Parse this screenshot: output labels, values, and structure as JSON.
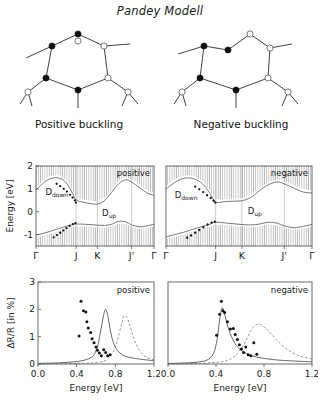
{
  "figure": {
    "title": "Pandey Modell",
    "captions": {
      "left": "Positive buckling",
      "right": "Negative buckling"
    }
  },
  "structures": {
    "left": {
      "name": "positive-buckling-chain",
      "buckling": "positive",
      "atom_fill_legend": {
        "filled": "raised atom",
        "open": "lowered atom"
      }
    },
    "right": {
      "name": "negative-buckling-chain",
      "buckling": "negative",
      "atom_fill_legend": {
        "filled": "raised atom",
        "open": "lowered atom"
      }
    }
  },
  "chart_data": [
    {
      "id": "band-positive",
      "type": "line",
      "title": "",
      "corner_label": "positive",
      "xlabel": "",
      "ylabel": "Energy [eV]",
      "ylim": [
        -1.5,
        2
      ],
      "yticks": [
        2,
        1,
        0,
        -1
      ],
      "ytick_labels": [
        "2",
        "1",
        "0",
        "-1"
      ],
      "kpoints": [
        "Γ",
        "J",
        "K",
        "J'",
        "Γ"
      ],
      "kpositions": [
        0,
        0.34,
        0.52,
        0.81,
        1.0
      ],
      "band_labels": [
        {
          "text": "D",
          "sub": "down",
          "x": 0.08,
          "y": 0.72
        },
        {
          "text": "D",
          "sub": "up",
          "x": 0.56,
          "y": -0.18
        }
      ],
      "series": [
        {
          "name": "D_down",
          "x": [
            0.0,
            0.05,
            0.1,
            0.15,
            0.2,
            0.25,
            0.3,
            0.34,
            0.4,
            0.46,
            0.52,
            0.58,
            0.64,
            0.7,
            0.76,
            0.81,
            0.88,
            0.94,
            1.0
          ],
          "values": [
            0.95,
            1.2,
            1.4,
            1.48,
            1.46,
            1.3,
            0.9,
            0.52,
            0.42,
            0.36,
            0.33,
            0.48,
            0.85,
            1.22,
            1.4,
            1.3,
            1.05,
            0.82,
            0.72
          ]
        },
        {
          "name": "D_up",
          "x": [
            0.0,
            0.06,
            0.12,
            0.18,
            0.24,
            0.3,
            0.34,
            0.42,
            0.5,
            0.58,
            0.64,
            0.7,
            0.76,
            0.81,
            0.88,
            0.94,
            1.0
          ],
          "values": [
            -1.02,
            -0.95,
            -0.86,
            -0.76,
            -0.66,
            -0.58,
            -0.54,
            -0.55,
            -0.58,
            -0.6,
            -0.55,
            -0.42,
            -0.44,
            -0.58,
            -0.66,
            -0.62,
            -0.55
          ]
        }
      ],
      "experimental_points": [
        {
          "x": 0.175,
          "y": 1.22
        },
        {
          "x": 0.205,
          "y": 1.12
        },
        {
          "x": 0.235,
          "y": 1.0
        },
        {
          "x": 0.262,
          "y": 0.88
        },
        {
          "x": 0.288,
          "y": 0.74
        },
        {
          "x": 0.31,
          "y": 0.62
        },
        {
          "x": 0.33,
          "y": 0.5
        },
        {
          "x": 0.338,
          "y": 0.4
        },
        {
          "x": 0.15,
          "y": -1.12
        },
        {
          "x": 0.178,
          "y": -1.02
        },
        {
          "x": 0.205,
          "y": -0.92
        },
        {
          "x": 0.232,
          "y": -0.82
        },
        {
          "x": 0.258,
          "y": -0.72
        },
        {
          "x": 0.285,
          "y": -0.62
        },
        {
          "x": 0.312,
          "y": -0.54
        },
        {
          "x": 0.334,
          "y": -0.5
        }
      ],
      "shaded_regions": "projected bulk bands (vertical hatching)"
    },
    {
      "id": "band-negative",
      "type": "line",
      "title": "",
      "corner_label": "negative",
      "xlabel": "",
      "ylabel": "",
      "ylim": [
        -1.5,
        2
      ],
      "yticks": [
        2,
        1,
        0,
        -1
      ],
      "ytick_labels": [
        "2",
        "1",
        "0",
        "-1"
      ],
      "kpoints": [
        "Γ",
        "J",
        "K",
        "J'",
        "Γ"
      ],
      "kpositions": [
        0,
        0.34,
        0.52,
        0.81,
        1.0
      ],
      "band_labels": [
        {
          "text": "D",
          "sub": "down",
          "x": 0.06,
          "y": 0.62
        },
        {
          "text": "D",
          "sub": "up",
          "x": 0.56,
          "y": -0.12
        }
      ],
      "series": [
        {
          "name": "D_down",
          "x": [
            0.0,
            0.05,
            0.1,
            0.15,
            0.2,
            0.25,
            0.3,
            0.34,
            0.4,
            0.46,
            0.52,
            0.58,
            0.64,
            0.7,
            0.76,
            0.81,
            0.88,
            0.94,
            1.0
          ],
          "values": [
            1.0,
            1.24,
            1.42,
            1.48,
            1.42,
            1.22,
            0.82,
            0.42,
            0.44,
            0.46,
            0.48,
            0.62,
            0.92,
            1.18,
            1.3,
            1.22,
            1.02,
            0.86,
            0.82
          ]
        },
        {
          "name": "D_up",
          "x": [
            0.0,
            0.06,
            0.12,
            0.18,
            0.24,
            0.3,
            0.34,
            0.42,
            0.5,
            0.58,
            0.64,
            0.7,
            0.76,
            0.81,
            0.88,
            0.94,
            1.0
          ],
          "values": [
            -1.1,
            -1.0,
            -0.9,
            -0.78,
            -0.66,
            -0.55,
            -0.46,
            -0.5,
            -0.55,
            -0.58,
            -0.54,
            -0.46,
            -0.5,
            -0.62,
            -0.7,
            -0.64,
            -0.56
          ]
        }
      ],
      "experimental_points": [
        {
          "x": 0.2,
          "y": 1.1
        },
        {
          "x": 0.228,
          "y": 0.98
        },
        {
          "x": 0.255,
          "y": 0.86
        },
        {
          "x": 0.282,
          "y": 0.72
        },
        {
          "x": 0.306,
          "y": 0.6
        },
        {
          "x": 0.326,
          "y": 0.48
        },
        {
          "x": 0.338,
          "y": 0.4
        },
        {
          "x": 0.145,
          "y": -1.14
        },
        {
          "x": 0.172,
          "y": -1.04
        },
        {
          "x": 0.2,
          "y": -0.92
        },
        {
          "x": 0.228,
          "y": -0.8
        },
        {
          "x": 0.256,
          "y": -0.68
        },
        {
          "x": 0.285,
          "y": -0.56
        },
        {
          "x": 0.312,
          "y": -0.48
        },
        {
          "x": 0.334,
          "y": -0.44
        }
      ],
      "shaded_regions": "projected bulk bands (vertical hatching)"
    },
    {
      "id": "spectrum-positive",
      "type": "line",
      "corner_label": "positive",
      "xlabel": "Energy [eV]",
      "ylabel": "ΔR/R  [in %]",
      "xlim": [
        0.0,
        1.2
      ],
      "ylim": [
        0,
        3
      ],
      "xticks": [
        0.0,
        0.4,
        0.8,
        1.2
      ],
      "xtick_labels": [
        "0.0",
        "0.4",
        "0.8",
        "1.2"
      ],
      "yticks": [
        0,
        1,
        2,
        3
      ],
      "ytick_labels": [
        "0",
        "1",
        "2",
        "3"
      ],
      "series": [
        {
          "name": "theory-solid",
          "style": "solid",
          "x": [
            0.0,
            0.1,
            0.2,
            0.3,
            0.4,
            0.48,
            0.54,
            0.58,
            0.62,
            0.65,
            0.68,
            0.7,
            0.72,
            0.75,
            0.78,
            0.82,
            0.88,
            0.95,
            1.05,
            1.2
          ],
          "values": [
            0.02,
            0.03,
            0.04,
            0.06,
            0.09,
            0.14,
            0.22,
            0.34,
            0.7,
            1.25,
            1.8,
            2.0,
            1.8,
            1.2,
            0.78,
            0.5,
            0.32,
            0.24,
            0.18,
            0.12
          ]
        },
        {
          "name": "theory-dashed",
          "style": "dashed",
          "x": [
            0.0,
            0.2,
            0.4,
            0.55,
            0.65,
            0.72,
            0.78,
            0.82,
            0.86,
            0.89,
            0.92,
            0.96,
            1.0,
            1.06,
            1.12,
            1.2
          ],
          "values": [
            0.0,
            0.01,
            0.02,
            0.04,
            0.08,
            0.18,
            0.45,
            0.85,
            1.4,
            1.75,
            1.7,
            1.3,
            0.85,
            0.45,
            0.25,
            0.15
          ]
        }
      ],
      "experimental_points": [
        {
          "x": 0.425,
          "y": 1.02
        },
        {
          "x": 0.445,
          "y": 2.3
        },
        {
          "x": 0.47,
          "y": 1.95
        },
        {
          "x": 0.495,
          "y": 1.9
        },
        {
          "x": 0.505,
          "y": 1.55
        },
        {
          "x": 0.52,
          "y": 1.32
        },
        {
          "x": 0.545,
          "y": 1.15
        },
        {
          "x": 0.56,
          "y": 0.92
        },
        {
          "x": 0.58,
          "y": 0.78
        },
        {
          "x": 0.6,
          "y": 0.62
        },
        {
          "x": 0.615,
          "y": 0.5
        },
        {
          "x": 0.635,
          "y": 0.4
        },
        {
          "x": 0.655,
          "y": 0.3
        },
        {
          "x": 0.68,
          "y": 0.52
        },
        {
          "x": 0.7,
          "y": 0.42
        },
        {
          "x": 0.72,
          "y": 0.3
        },
        {
          "x": 0.745,
          "y": 0.34
        }
      ]
    },
    {
      "id": "spectrum-negative",
      "type": "line",
      "corner_label": "negative",
      "xlabel": "Energy [eV]",
      "ylabel": "",
      "xlim": [
        0.0,
        1.2
      ],
      "ylim": [
        0,
        3
      ],
      "xticks": [
        0.0,
        0.4,
        0.8,
        1.2
      ],
      "xtick_labels": [
        "0.0",
        "0.4",
        "0.8",
        "1.2"
      ],
      "yticks": [
        0,
        1,
        2,
        3
      ],
      "ytick_labels": [
        "0",
        "1",
        "2",
        "3"
      ],
      "series": [
        {
          "name": "theory-solid",
          "style": "solid",
          "x": [
            0.0,
            0.1,
            0.2,
            0.28,
            0.34,
            0.38,
            0.41,
            0.43,
            0.45,
            0.47,
            0.5,
            0.54,
            0.58,
            0.63,
            0.7,
            0.78,
            0.88,
            1.0,
            1.2
          ],
          "values": [
            0.02,
            0.03,
            0.05,
            0.09,
            0.18,
            0.4,
            0.9,
            1.6,
            2.05,
            1.85,
            1.35,
            0.9,
            0.62,
            0.44,
            0.3,
            0.22,
            0.16,
            0.12,
            0.08
          ]
        },
        {
          "name": "theory-dashed",
          "style": "dashed",
          "x": [
            0.0,
            0.15,
            0.3,
            0.42,
            0.5,
            0.56,
            0.62,
            0.66,
            0.7,
            0.74,
            0.78,
            0.84,
            0.9,
            0.98,
            1.08,
            1.2
          ],
          "values": [
            0.0,
            0.01,
            0.03,
            0.07,
            0.14,
            0.3,
            0.62,
            0.95,
            1.28,
            1.45,
            1.42,
            1.2,
            0.9,
            0.58,
            0.32,
            0.18
          ]
        }
      ],
      "experimental_points": [
        {
          "x": 0.405,
          "y": 1.05
        },
        {
          "x": 0.43,
          "y": 1.82
        },
        {
          "x": 0.445,
          "y": 2.3
        },
        {
          "x": 0.458,
          "y": 1.95
        },
        {
          "x": 0.472,
          "y": 1.88
        },
        {
          "x": 0.495,
          "y": 1.55
        },
        {
          "x": 0.52,
          "y": 1.28
        },
        {
          "x": 0.545,
          "y": 1.3
        },
        {
          "x": 0.56,
          "y": 1.08
        },
        {
          "x": 0.578,
          "y": 0.9
        },
        {
          "x": 0.595,
          "y": 0.7
        },
        {
          "x": 0.612,
          "y": 0.55
        },
        {
          "x": 0.63,
          "y": 0.42
        },
        {
          "x": 0.648,
          "y": 0.62
        },
        {
          "x": 0.668,
          "y": 0.34
        },
        {
          "x": 0.69,
          "y": 0.3
        },
        {
          "x": 0.715,
          "y": 0.78
        },
        {
          "x": 0.74,
          "y": 0.36
        }
      ]
    }
  ]
}
